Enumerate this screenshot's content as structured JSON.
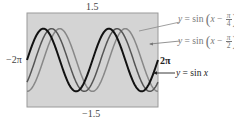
{
  "chart_data": {
    "type": "line",
    "title": "",
    "xlabel": "",
    "ylabel": "",
    "xlim": [
      -6.2832,
      6.2832
    ],
    "ylim": [
      -1.5,
      1.5
    ],
    "grid": false,
    "tick_labels": {
      "xmin": "−2π",
      "xmax": "2π",
      "ymax": "1.5",
      "ymin": "−1.5"
    },
    "series": [
      {
        "name": "y = sin x",
        "function": "sin(x)",
        "shift": 0,
        "color": "#111111",
        "width": 2.0
      },
      {
        "name": "y = sin(x − π/4)",
        "function": "sin(x - pi/4)",
        "shift": 0.7854,
        "color": "#555555",
        "width": 1.5
      },
      {
        "name": "y = sin(x − π/2)",
        "function": "sin(x - pi/2)",
        "shift": 1.5708,
        "color": "#888888",
        "width": 1.5
      }
    ],
    "legend_position": "right, leader-line callouts",
    "plot_background": "#d4d4d4"
  },
  "labels": {
    "ymax": "1.5",
    "ymin": "−1.5",
    "xmin": "−2π",
    "xmax": "2π"
  },
  "legend": {
    "shift_pi4": {
      "prefix": "y",
      "eq": " = sin ",
      "var": "x",
      "minus": " − ",
      "num": "π",
      "den": "4"
    },
    "shift_pi2": {
      "prefix": "y",
      "eq": " = sin ",
      "var": "x",
      "minus": " − ",
      "num": "π",
      "den": "2"
    },
    "base": {
      "prefix": "y",
      "eq": " = sin ",
      "var": "x"
    }
  }
}
